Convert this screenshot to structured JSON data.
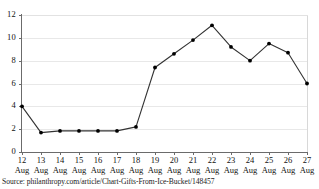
{
  "chart_data": {
    "type": "line",
    "title": "",
    "xlabel": "",
    "ylabel": "",
    "categories": [
      "12 Aug",
      "13 Aug",
      "14 Aug",
      "15 Aug",
      "16 Aug",
      "17 Aug",
      "18 Aug",
      "19 Aug",
      "20 Aug",
      "21 Aug",
      "22 Aug",
      "23 Aug",
      "24 Aug",
      "25 Aug",
      "26 Aug",
      "27 Aug"
    ],
    "x_tick_days": [
      "12",
      "13",
      "14",
      "15",
      "16",
      "17",
      "18",
      "19",
      "20",
      "21",
      "22",
      "23",
      "24",
      "25",
      "26",
      "27"
    ],
    "x_tick_month": "Aug",
    "values": [
      4.0,
      1.7,
      1.85,
      1.85,
      1.85,
      1.85,
      2.2,
      7.4,
      8.6,
      9.8,
      11.1,
      9.2,
      8.0,
      9.5,
      8.7,
      6.0
    ],
    "ylim": [
      0,
      12
    ],
    "y_ticks": [
      "12",
      "10",
      "8",
      "6",
      "4",
      "2",
      "0"
    ],
    "y_tick_values": [
      12,
      10,
      8,
      6,
      4,
      2,
      0
    ],
    "grid": true,
    "legend": "none",
    "line_color": "#333333",
    "marker_color": "#000000",
    "grid_color": "#e8e8e8",
    "axis_color": "#6b6b6b"
  },
  "source": {
    "text": "Source: philanthropy.com/article/Chart-Gifts-From-Ice-Bucket/148457"
  }
}
